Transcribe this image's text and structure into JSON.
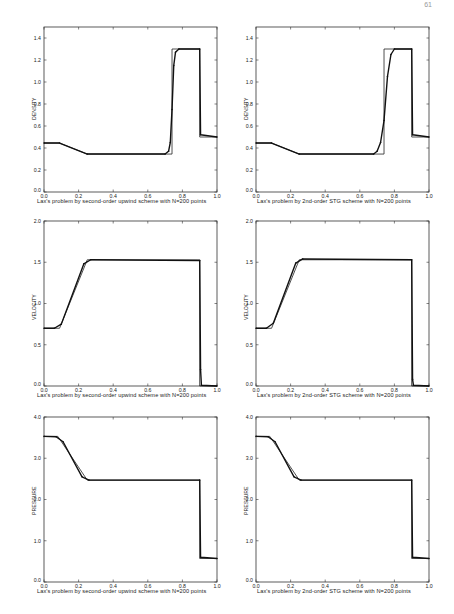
{
  "page": {
    "number": "61"
  },
  "figures": [
    {
      "id": "density-upwind",
      "ylabel": "DENSITY",
      "caption": "Lax's problem by second-order upwind scheme with N=200 points"
    },
    {
      "id": "density-stg",
      "ylabel": "DENSITY",
      "caption": "Lax's problem by 2nd-order STG scheme with N=200 points"
    },
    {
      "id": "velocity-upwind",
      "ylabel": "VELOCITY",
      "caption": "Lax's problem by second-order upwind scheme with N=200 points"
    },
    {
      "id": "velocity-stg",
      "ylabel": "VELOCITY",
      "caption": "Lax's problem by 2nd-order STG scheme with N=200 points"
    },
    {
      "id": "pressure-upwind",
      "ylabel": "PRESSURE",
      "caption": "Lax's problem by second-order upwind scheme with N=200 points"
    },
    {
      "id": "pressure-stg",
      "ylabel": "PRESSURE",
      "caption": "Lax's problem by 2nd-order STG scheme with N=200 points"
    }
  ],
  "chart_data": [
    {
      "type": "line",
      "title": "",
      "xlabel": "Lax's problem by second-order upwind scheme with N=200 points",
      "ylabel": "DENSITY",
      "xlim": [
        0,
        1
      ],
      "ylim": [
        0,
        1.5
      ],
      "xticks": [
        "0.0",
        "0.2",
        "0.4",
        "0.6",
        "0.8",
        "1.0"
      ],
      "yticks": [
        "0.0",
        "0.2",
        "0.4",
        "0.6",
        "0.8",
        "1.0",
        "1.2",
        "1.4"
      ],
      "grid": false,
      "series": [
        {
          "name": "exact",
          "style": "line",
          "x": [
            0,
            0.09,
            0.25,
            0.74,
            0.74,
            0.9,
            0.9,
            1.0
          ],
          "y": [
            0.445,
            0.445,
            0.345,
            0.345,
            1.3,
            1.3,
            0.5,
            0.5
          ]
        },
        {
          "name": "numerical",
          "style": "dots",
          "x": [
            0,
            0.09,
            0.25,
            0.7,
            0.72,
            0.73,
            0.74,
            0.75,
            0.76,
            0.78,
            0.9,
            0.905,
            1.0
          ],
          "y": [
            0.445,
            0.445,
            0.345,
            0.345,
            0.37,
            0.45,
            0.75,
            1.15,
            1.27,
            1.3,
            1.3,
            0.52,
            0.5
          ]
        }
      ]
    },
    {
      "type": "line",
      "title": "",
      "xlabel": "Lax's problem by 2nd-order STG scheme with N=200 points",
      "ylabel": "DENSITY",
      "xlim": [
        0,
        1
      ],
      "ylim": [
        0,
        1.5
      ],
      "xticks": [
        "0.0",
        "0.2",
        "0.4",
        "0.6",
        "0.8",
        "1.0"
      ],
      "yticks": [
        "0.0",
        "0.2",
        "0.4",
        "0.6",
        "0.8",
        "1.0",
        "1.2",
        "1.4"
      ],
      "grid": false,
      "series": [
        {
          "name": "exact",
          "style": "line",
          "x": [
            0,
            0.09,
            0.25,
            0.74,
            0.74,
            0.9,
            0.9,
            1.0
          ],
          "y": [
            0.445,
            0.445,
            0.345,
            0.345,
            1.3,
            1.3,
            0.5,
            0.5
          ]
        },
        {
          "name": "numerical",
          "style": "dots",
          "x": [
            0,
            0.09,
            0.25,
            0.68,
            0.7,
            0.72,
            0.74,
            0.76,
            0.78,
            0.8,
            0.9,
            0.905,
            1.0
          ],
          "y": [
            0.445,
            0.445,
            0.345,
            0.345,
            0.37,
            0.45,
            0.65,
            1.05,
            1.25,
            1.3,
            1.3,
            0.52,
            0.5
          ]
        }
      ]
    },
    {
      "type": "line",
      "title": "",
      "xlabel": "Lax's problem by second-order upwind scheme with N=200 points",
      "ylabel": "VELOCITY",
      "xlim": [
        0,
        1
      ],
      "ylim": [
        0,
        2.0
      ],
      "xticks": [
        "0.0",
        "0.2",
        "0.4",
        "0.6",
        "0.8",
        "1.0"
      ],
      "yticks": [
        "0.0",
        "0.5",
        "1.0",
        "1.5",
        "2.0"
      ],
      "grid": false,
      "series": [
        {
          "name": "exact",
          "style": "line",
          "x": [
            0,
            0.09,
            0.25,
            0.9,
            0.9,
            1.0
          ],
          "y": [
            0.7,
            0.7,
            1.53,
            1.53,
            0,
            0
          ]
        },
        {
          "name": "numerical",
          "style": "dots",
          "x": [
            0,
            0.06,
            0.1,
            0.23,
            0.27,
            0.9,
            0.905,
            0.91,
            1.0
          ],
          "y": [
            0.7,
            0.7,
            0.75,
            1.48,
            1.53,
            1.52,
            0.2,
            0.01,
            0
          ]
        }
      ]
    },
    {
      "type": "line",
      "title": "",
      "xlabel": "Lax's problem by 2nd-order STG scheme with N=200 points",
      "ylabel": "VELOCITY",
      "xlim": [
        0,
        1
      ],
      "ylim": [
        0,
        2.0
      ],
      "xticks": [
        "0.0",
        "0.2",
        "0.4",
        "0.6",
        "0.8",
        "1.0"
      ],
      "yticks": [
        "0.0",
        "0.5",
        "1.0",
        "1.5",
        "2.0"
      ],
      "grid": false,
      "series": [
        {
          "name": "exact",
          "style": "line",
          "x": [
            0,
            0.09,
            0.25,
            0.9,
            0.9,
            1.0
          ],
          "y": [
            0.7,
            0.7,
            1.53,
            1.53,
            0,
            0
          ]
        },
        {
          "name": "numerical",
          "style": "dots",
          "x": [
            0,
            0.06,
            0.1,
            0.23,
            0.27,
            0.9,
            0.905,
            0.91,
            1.0
          ],
          "y": [
            0.7,
            0.7,
            0.76,
            1.49,
            1.54,
            1.53,
            0.08,
            0.01,
            0
          ]
        }
      ]
    },
    {
      "type": "line",
      "title": "",
      "xlabel": "Lax's problem by second-order upwind scheme with N=200 points",
      "ylabel": "PRESSURE",
      "xlim": [
        0,
        1
      ],
      "ylim": [
        0,
        4.0
      ],
      "xticks": [
        "0.0",
        "0.2",
        "0.4",
        "0.6",
        "0.8",
        "1.0"
      ],
      "yticks": [
        "0.0",
        "1.0",
        "2.0",
        "3.0",
        "4.0"
      ],
      "grid": false,
      "series": [
        {
          "name": "exact",
          "style": "line",
          "x": [
            0,
            0.08,
            0.25,
            0.9,
            0.9,
            1.0
          ],
          "y": [
            3.53,
            3.53,
            2.47,
            2.47,
            0.57,
            0.57
          ]
        },
        {
          "name": "numerical",
          "style": "dots",
          "x": [
            0,
            0.07,
            0.11,
            0.22,
            0.26,
            0.9,
            0.905,
            1.0
          ],
          "y": [
            3.53,
            3.52,
            3.4,
            2.55,
            2.47,
            2.47,
            0.6,
            0.57
          ]
        }
      ]
    },
    {
      "type": "line",
      "title": "",
      "xlabel": "Lax's problem by 2nd-order STG scheme with N=200 points",
      "ylabel": "PRESSURE",
      "xlim": [
        0,
        1
      ],
      "ylim": [
        0,
        4.0
      ],
      "xticks": [
        "0.0",
        "0.2",
        "0.4",
        "0.6",
        "0.8",
        "1.0"
      ],
      "yticks": [
        "0.0",
        "1.0",
        "2.0",
        "3.0",
        "4.0"
      ],
      "grid": false,
      "series": [
        {
          "name": "exact",
          "style": "line",
          "x": [
            0,
            0.08,
            0.25,
            0.9,
            0.9,
            1.0
          ],
          "y": [
            3.53,
            3.53,
            2.47,
            2.47,
            0.57,
            0.57
          ]
        },
        {
          "name": "numerical",
          "style": "dots",
          "x": [
            0,
            0.07,
            0.11,
            0.22,
            0.26,
            0.9,
            0.905,
            1.0
          ],
          "y": [
            3.53,
            3.52,
            3.4,
            2.55,
            2.47,
            2.47,
            0.6,
            0.57
          ]
        }
      ]
    }
  ]
}
